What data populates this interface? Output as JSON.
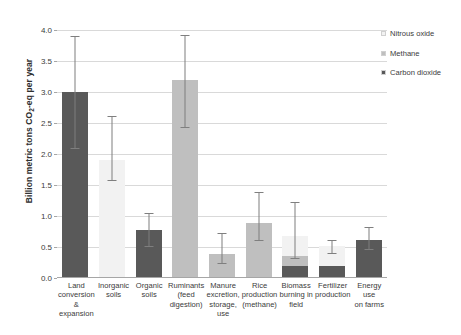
{
  "chart_data": {
    "type": "bar",
    "title": "",
    "subtitle": "",
    "xlabel": "",
    "ylabel": "Billion metric tons CO2-eq per year",
    "ylim": [
      0.0,
      4.0
    ],
    "ytick_values": [
      0.0,
      0.5,
      1.0,
      1.5,
      2.0,
      2.5,
      3.0,
      3.5,
      4.0
    ],
    "ytick_labels": [
      "0.0",
      "0.5",
      "1.0",
      "1.5",
      "2.0",
      "2.5",
      "3.0",
      "3.5",
      "4.0"
    ],
    "grid": true,
    "stacked": true,
    "legend_position": "top-right",
    "legend": [
      "Nitrous oxide",
      "Methane",
      "Carbon dioxide"
    ],
    "series": [
      {
        "name": "Carbon dioxide",
        "color": "#595959",
        "values": [
          3.0,
          0.0,
          0.78,
          0.0,
          0.0,
          0.0,
          0.2,
          0.2,
          0.62
        ]
      },
      {
        "name": "Methane",
        "color": "#bfbfbf",
        "values": [
          0.0,
          0.0,
          0.0,
          3.2,
          0.38,
          0.88,
          0.16,
          0.0,
          0.0
        ]
      },
      {
        "name": "Nitrous oxide",
        "color": "#f2f2f2",
        "values": [
          0.0,
          1.9,
          0.0,
          0.0,
          0.0,
          0.0,
          0.32,
          0.31,
          0.0
        ]
      }
    ],
    "categories": [
      "Land conversion & expansion",
      "Inorganic soils",
      "Organic soils",
      "Ruminants (feed digestion)",
      "Manure excretion, storage, use",
      "Rice production (methane)",
      "Biomass burning in field",
      "Fertilizer production",
      "Energy use on farms"
    ],
    "category_lines": [
      [
        "Land",
        "conversion",
        "&",
        "expansion"
      ],
      [
        "Inorganic",
        "soils"
      ],
      [
        "Organic",
        "soils"
      ],
      [
        "Ruminants",
        "(feed",
        "digestion)"
      ],
      [
        "Manure",
        "excretion,",
        "storage,",
        "use"
      ],
      [
        "Rice",
        "production",
        "(methane)"
      ],
      [
        "Biomass",
        "burning in",
        "field"
      ],
      [
        "Fertilizer",
        "production"
      ],
      [
        "Energy use",
        "on farms"
      ]
    ],
    "totals": [
      3.0,
      1.9,
      0.78,
      3.2,
      0.38,
      0.88,
      0.68,
      0.51,
      0.62
    ],
    "error_bars": [
      {
        "low": 2.1,
        "high": 3.9
      },
      {
        "low": 1.58,
        "high": 2.62
      },
      {
        "low": 0.52,
        "high": 1.05
      },
      {
        "low": 2.44,
        "high": 3.92
      },
      {
        "low": 0.24,
        "high": 0.72
      },
      {
        "low": 0.62,
        "high": 1.38
      },
      {
        "low": 0.32,
        "high": 1.22
      },
      {
        "low": 0.4,
        "high": 0.62
      },
      {
        "low": 0.46,
        "high": 0.82
      }
    ]
  },
  "legend_items": [
    {
      "label": "Nitrous oxide",
      "color": "#f2f2f2"
    },
    {
      "label": "Methane",
      "color": "#bfbfbf"
    },
    {
      "label": "Carbon dioxide",
      "color": "#595959"
    }
  ],
  "axis": {
    "y_title_main": "Billion metric tons CO",
    "y_title_sub": "2",
    "y_title_tail": "-eq per year"
  }
}
